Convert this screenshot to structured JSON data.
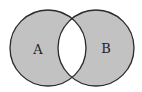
{
  "diagram": {
    "type": "venn",
    "sets": [
      {
        "label": "A",
        "cx": 48,
        "cy": 48,
        "r": 38
      },
      {
        "label": "B",
        "cx": 96,
        "cy": 48,
        "r": 38
      }
    ],
    "shaded_region": "symmetric-difference",
    "colors": {
      "fill": "#c2c2c2",
      "stroke": "#2a2a2a",
      "intersection": "#ffffff",
      "background": "#ffffff"
    }
  },
  "labels": {
    "a": "A",
    "b": "B"
  }
}
